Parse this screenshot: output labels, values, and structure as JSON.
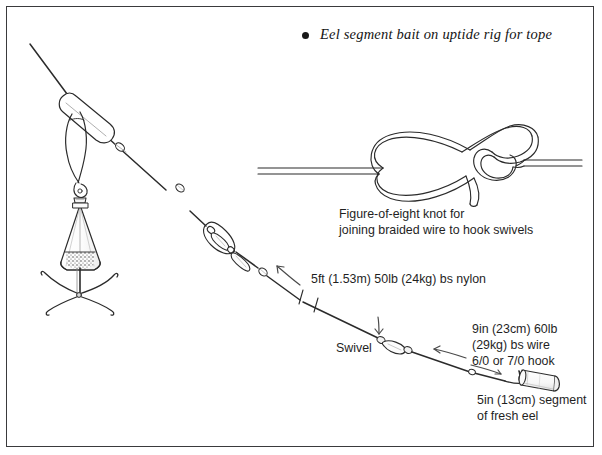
{
  "figure": {
    "title": "Eel segment bait on uptide rig for tope",
    "title_bullet": "•",
    "border_color": "#3a3a3c",
    "ink_color": "#2b2b2b",
    "background": "#ffffff"
  },
  "labels": {
    "knot_caption": "Figure-of-eight knot for\njoining braided wire to hook swivels",
    "nylon": "5ft (1.53m) 50lb (24kg) bs nylon",
    "swivel": "Swivel",
    "wire_hook": "9in (23cm) 60lb\n(29kg) bs wire\n6/0 or 7/0 hook",
    "eel_segment": "5in (13cm) segment\nof fresh eel"
  },
  "components": {
    "lead_weight": "breakaway-grip-lead",
    "link_slider": "line-slider-link",
    "beads": 2,
    "swivels": 3,
    "hook": "6/0 or 7/0 hook",
    "bait": "eel segment",
    "knot": "figure-of-eight knot"
  }
}
